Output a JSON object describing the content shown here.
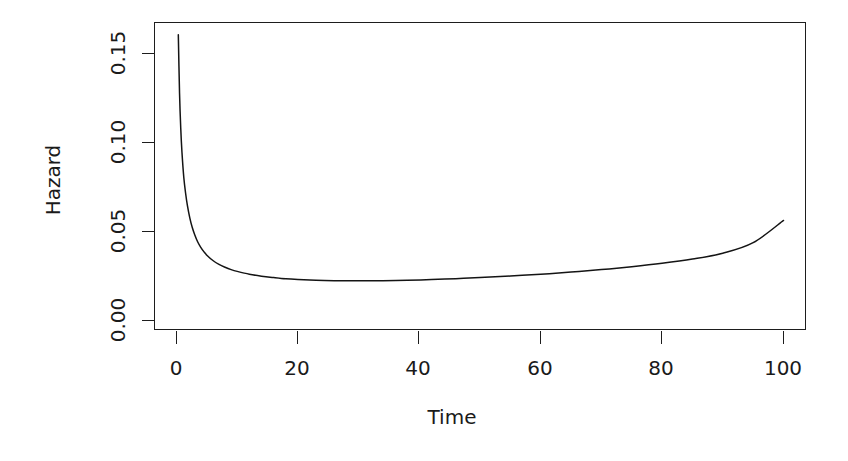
{
  "chart_data": {
    "type": "line",
    "title": "",
    "xlabel": "Time",
    "ylabel": "Hazard",
    "xlim": [
      -3,
      103
    ],
    "ylim": [
      -0.004,
      0.1735
    ],
    "xticks": [
      0,
      20,
      40,
      60,
      80,
      100
    ],
    "xtick_labels": [
      "0",
      "20",
      "40",
      "60",
      "80",
      "100"
    ],
    "yticks": [
      0.0,
      0.05,
      0.1,
      0.15
    ],
    "ytick_labels": [
      "0.00",
      "0.05",
      "0.10",
      "0.15"
    ],
    "grid": false,
    "legend": null,
    "box": "full-rectangle",
    "line_color": "#141414",
    "series": [
      {
        "name": "Hazard",
        "x": [
          0.3,
          0.5,
          0.7,
          0.9,
          1.2,
          1.5,
          1.8,
          2.2,
          2.6,
          3.0,
          3.5,
          4.0,
          4.5,
          5.0,
          6.0,
          7.0,
          8.0,
          9.0,
          10.0,
          12.0,
          14.0,
          16.0,
          18.0,
          20.0,
          23.0,
          26.0,
          30.0,
          34.0,
          38.0,
          42.0,
          46.0,
          50.0,
          55.0,
          60.0,
          65.0,
          70.0,
          75.0,
          80.0,
          85.0,
          90.0,
          95.0,
          100.0
        ],
        "y": [
          0.1605,
          0.128,
          0.108,
          0.0945,
          0.0805,
          0.0715,
          0.0645,
          0.0575,
          0.0522,
          0.0482,
          0.0441,
          0.0411,
          0.0387,
          0.0367,
          0.0337,
          0.0315,
          0.0299,
          0.0286,
          0.0276,
          0.026,
          0.0249,
          0.0241,
          0.0234,
          0.023,
          0.0226,
          0.0224,
          0.0223,
          0.0224,
          0.0226,
          0.023,
          0.0235,
          0.0241,
          0.025,
          0.026,
          0.0272,
          0.0286,
          0.0302,
          0.0321,
          0.0345,
          0.0378,
          0.0437,
          0.0562
        ]
      }
    ]
  },
  "labels": {
    "y_axis_title": "Hazard",
    "x_axis_title": "Time"
  }
}
